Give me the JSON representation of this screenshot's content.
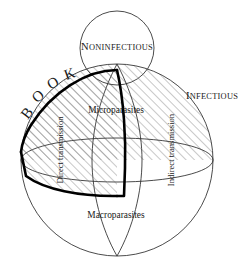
{
  "figure": {
    "background_color": "#ffffff",
    "line_color": "#2b2b2b",
    "outline_color": "#000000",
    "hatch_color": "#6e6e6e"
  },
  "labels": {
    "noninfectious": {
      "text": "NONINFECTIOUS",
      "first_letter": "N",
      "rest": "ONINFECTIOUS",
      "style": "small-caps"
    },
    "infectious": {
      "text": "INFECTIOUS",
      "first_letter": "I",
      "rest": "NFECTIOUS",
      "style": "small-caps"
    },
    "book": {
      "text": "BOOK",
      "letters": [
        "B",
        "O",
        "O",
        "K"
      ],
      "style": "arc-curved"
    },
    "microparasites": {
      "text": "Microparasites"
    },
    "macroparasites": {
      "text": "Macroparasites"
    },
    "direct_transmission": {
      "text": "Direct transmission",
      "orientation": "vertical-bottom-to-top"
    },
    "indirect_transmission": {
      "text": "Indirect transmission",
      "orientation": "vertical-bottom-to-top"
    }
  },
  "geometry": {
    "sphere": {
      "cx": 117,
      "cy": 160,
      "r": 96
    },
    "small_circle": {
      "cx": 117,
      "cy": 48,
      "r": 37
    },
    "equator": {
      "cx": 117,
      "cy": 160,
      "rx": 96,
      "ry": 22
    },
    "wedge": {
      "apex_x": 117,
      "apex_y": 70,
      "description": "hatched quarter wedge with heavy outline"
    }
  }
}
